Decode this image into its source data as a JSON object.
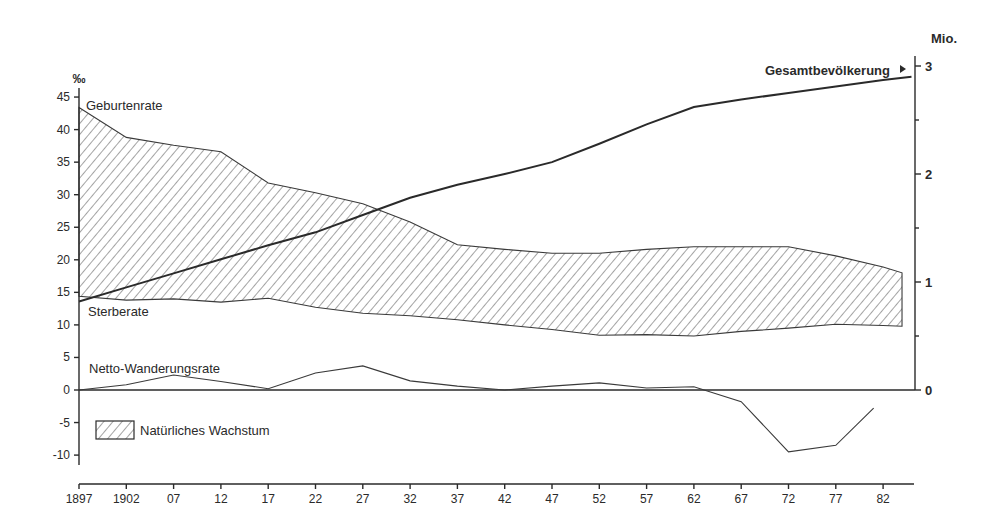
{
  "chart_data": {
    "type": "line",
    "title": "",
    "xlabel": "",
    "ylabel_left": "‰",
    "ylabel_right": "Mio.",
    "x_tick_labels": [
      "1897",
      "1902",
      "07",
      "12",
      "17",
      "22",
      "27",
      "32",
      "37",
      "42",
      "47",
      "52",
      "57",
      "62",
      "67",
      "72",
      "77",
      "82"
    ],
    "x_ticks": [
      1897,
      1902,
      1907,
      1912,
      1917,
      1922,
      1927,
      1932,
      1937,
      1942,
      1947,
      1952,
      1957,
      1962,
      1967,
      1972,
      1977,
      1982
    ],
    "xlim": [
      1897,
      1985
    ],
    "ylim_left": [
      -11,
      47
    ],
    "y_ticks_left": [
      45,
      40,
      35,
      30,
      25,
      20,
      15,
      10,
      5,
      0,
      -5,
      -10
    ],
    "y_tick_labels_left": [
      "45",
      "40",
      "35",
      "30",
      "25",
      "20",
      "15",
      "10",
      "5",
      "0",
      "-5",
      "-10"
    ],
    "ylim_right": [
      0,
      3
    ],
    "y_ticks_right": [
      0,
      1,
      2,
      3
    ],
    "y_tick_labels_right": [
      "0",
      "1",
      "2",
      "3"
    ],
    "y_minor_ticks_right": [
      0.5,
      1.5,
      2.5
    ],
    "grid": false,
    "series": [
      {
        "name": "Geburtenrate",
        "axis": "left",
        "x": [
          1897,
          1902,
          1907,
          1912,
          1917,
          1922,
          1927,
          1932,
          1937,
          1942,
          1947,
          1952,
          1957,
          1962,
          1967,
          1972,
          1977,
          1982,
          1984
        ],
        "values": [
          43.4,
          38.8,
          37.6,
          36.6,
          31.8,
          30.3,
          28.6,
          25.8,
          22.3,
          21.6,
          21.0,
          21.0,
          21.6,
          22.0,
          22.0,
          22.0,
          20.6,
          18.9,
          18.0
        ]
      },
      {
        "name": "Sterberate",
        "axis": "left",
        "x": [
          1897,
          1902,
          1907,
          1912,
          1917,
          1922,
          1927,
          1932,
          1937,
          1942,
          1947,
          1952,
          1957,
          1962,
          1967,
          1972,
          1977,
          1982,
          1984
        ],
        "values": [
          14.4,
          13.8,
          14.0,
          13.5,
          14.1,
          12.7,
          11.8,
          11.4,
          10.8,
          10.0,
          9.3,
          8.4,
          8.5,
          8.3,
          9.0,
          9.5,
          10.1,
          9.9,
          9.8
        ]
      },
      {
        "name": "Netto-Wanderungsrate",
        "axis": "left",
        "x": [
          1897,
          1902,
          1907,
          1912,
          1917,
          1922,
          1927,
          1932,
          1937,
          1942,
          1947,
          1952,
          1957,
          1962,
          1967,
          1972,
          1977,
          1981
        ],
        "values": [
          0.0,
          0.8,
          2.3,
          1.3,
          0.2,
          2.6,
          3.7,
          1.4,
          0.6,
          0.0,
          0.6,
          1.1,
          0.3,
          0.5,
          -1.8,
          -9.5,
          -8.5,
          -2.8
        ]
      },
      {
        "name": "Gesamtbevölkerung",
        "axis": "right",
        "unit": "Mio.",
        "x": [
          1897,
          1902,
          1907,
          1912,
          1917,
          1922,
          1927,
          1932,
          1937,
          1942,
          1947,
          1952,
          1957,
          1962,
          1967,
          1972,
          1977,
          1982,
          1985
        ],
        "values": [
          0.82,
          0.95,
          1.08,
          1.21,
          1.34,
          1.46,
          1.62,
          1.78,
          1.9,
          2.0,
          2.11,
          2.28,
          2.46,
          2.62,
          2.69,
          2.75,
          2.81,
          2.87,
          2.9
        ]
      }
    ],
    "shaded_area": {
      "name": "Natürliches Wachstum",
      "between": [
        "Geburtenrate",
        "Sterberate"
      ],
      "pattern": "diagonal-hatch"
    },
    "legend": {
      "entries": [
        "Natürliches Wachstum"
      ],
      "position": "lower-left"
    },
    "annotations": [
      {
        "text": "Geburtenrate",
        "near": "birth-rate line start"
      },
      {
        "text": "Sterberate",
        "near": "death-rate line start"
      },
      {
        "text": "Netto-Wanderungsrate",
        "near": "migration line start"
      },
      {
        "text": "Gesamtbevölkerung ▸",
        "near": "right axis top"
      }
    ]
  },
  "labels": {
    "left_unit": "‰",
    "right_unit": "Mio.",
    "birth": "Geburtenrate",
    "death": "Sterberate",
    "migration": "Netto-Wanderungsrate",
    "population": "Gesamtbevölkerung",
    "legend": "Natürliches Wachstum"
  },
  "colors": {
    "ink": "#2a2a2a",
    "background": "#ffffff",
    "hatch": "#4a4a4a"
  }
}
